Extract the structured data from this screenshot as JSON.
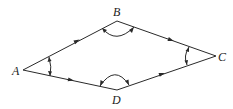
{
  "diagram": {
    "type": "quadrilateral",
    "vertices": {
      "A": {
        "label": "A",
        "x": 23,
        "y": 70
      },
      "B": {
        "label": "B",
        "x": 117,
        "y": 21
      },
      "C": {
        "label": "C",
        "x": 216,
        "y": 56
      },
      "D": {
        "label": "D",
        "x": 117,
        "y": 90
      }
    },
    "edges": [
      {
        "from": "A",
        "to": "B",
        "arrow": "toward B"
      },
      {
        "from": "B",
        "to": "C",
        "arrow": "toward C"
      },
      {
        "from": "A",
        "to": "D",
        "arrow": "toward D"
      },
      {
        "from": "D",
        "to": "C",
        "arrow": "toward C"
      }
    ],
    "angle_marks": [
      "A",
      "B",
      "C",
      "D"
    ],
    "line_color": "#2a2a2a"
  }
}
